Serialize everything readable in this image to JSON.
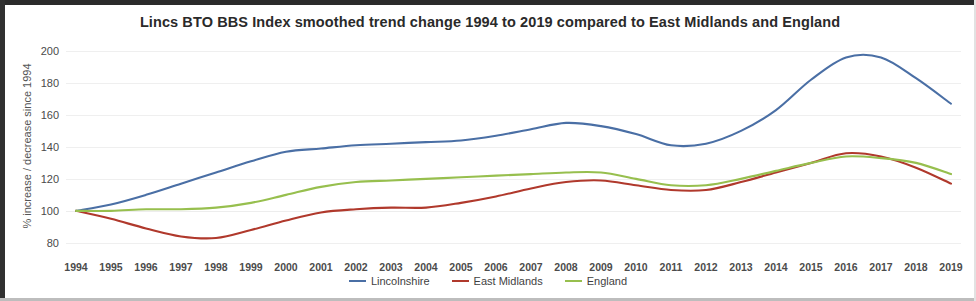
{
  "chart_data": {
    "type": "line",
    "title": "Lincs BTO BBS Index smoothed trend change 1994 to 2019 compared to East Midlands and England",
    "xlabel": "",
    "ylabel": "% increase / decrease since 1994",
    "ylim": [
      73,
      205
    ],
    "yticks": [
      80,
      100,
      120,
      140,
      160,
      180,
      200
    ],
    "grid": true,
    "legend_position": "bottom",
    "x": [
      1994,
      1995,
      1996,
      1997,
      1998,
      1999,
      2000,
      2001,
      2002,
      2003,
      2004,
      2005,
      2006,
      2007,
      2008,
      2009,
      2010,
      2011,
      2012,
      2013,
      2014,
      2015,
      2016,
      2017,
      2018,
      2019
    ],
    "categories": [
      "1994",
      "1995",
      "1996",
      "1997",
      "1998",
      "1999",
      "2000",
      "2001",
      "2002",
      "2003",
      "2004",
      "2005",
      "2006",
      "2007",
      "2008",
      "2009",
      "2010",
      "2011",
      "2012",
      "2013",
      "2014",
      "2015",
      "2016",
      "2017",
      "2018",
      "2019"
    ],
    "series": [
      {
        "name": "Lincolnshire",
        "color": "#4a6fa5",
        "values": [
          100,
          104,
          110,
          117,
          124,
          131,
          137,
          139,
          141,
          142,
          143,
          144,
          147,
          151,
          155,
          153,
          148,
          141,
          142,
          150,
          163,
          182,
          196,
          196,
          183,
          167
        ]
      },
      {
        "name": "East Midlands",
        "color": "#b0392c",
        "values": [
          100,
          95,
          89,
          84,
          83,
          88,
          94,
          99,
          101,
          102,
          102,
          105,
          109,
          114,
          118,
          119,
          116,
          113,
          113,
          118,
          124,
          130,
          136,
          134,
          127,
          117
        ]
      },
      {
        "name": "England",
        "color": "#97bf4e",
        "values": [
          100,
          100,
          101,
          101,
          102,
          105,
          110,
          115,
          118,
          119,
          120,
          121,
          122,
          123,
          124,
          124,
          120,
          116,
          116,
          120,
          125,
          130,
          134,
          133,
          130,
          123
        ]
      }
    ]
  },
  "legend": {
    "items": [
      {
        "label": "Lincolnshire",
        "color": "#4a6fa5"
      },
      {
        "label": "East Midlands",
        "color": "#b0392c"
      },
      {
        "label": "England",
        "color": "#97bf4e"
      }
    ]
  }
}
